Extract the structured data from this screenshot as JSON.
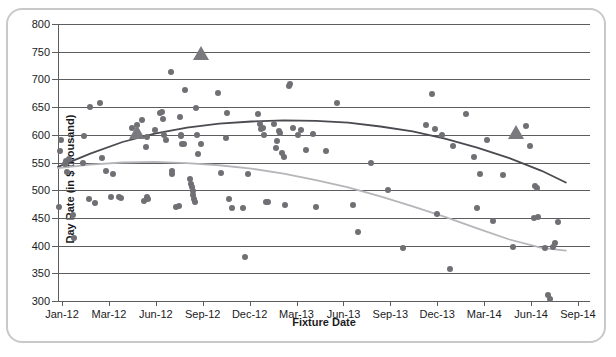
{
  "figure": {
    "title_sliver": "",
    "frame_color": "#c9c9cb"
  },
  "chart_data": {
    "type": "scatter",
    "title": "",
    "xlabel": "Fixture Date",
    "ylabel": "Day Rate (in $ thousand)",
    "ylim": [
      300,
      800
    ],
    "ytick_step": 50,
    "yticks": [
      300,
      350,
      400,
      450,
      500,
      550,
      600,
      650,
      700,
      750,
      800
    ],
    "xticks": [
      "Jan-12",
      "Mar-12",
      "Jun-12",
      "Sep-12",
      "Dec-12",
      "Mar-13",
      "Jun-13",
      "Sep-13",
      "Dec-13",
      "Mar-14",
      "Jun-14",
      "Sep-14"
    ],
    "xlim": [
      0,
      33
    ],
    "grid": "horizontal",
    "legend_position": "none",
    "colors": {
      "dot": "#6f6f74",
      "triangle": "#79797e",
      "trend_dark": "#4a4a50",
      "trend_light": "#b6b6ba",
      "axis": "#5d5d60"
    },
    "series": [
      {
        "name": "Day rate observations (circles)",
        "marker": "circle",
        "points": [
          [
            0.05,
            470
          ],
          [
            0.15,
            570
          ],
          [
            0.2,
            590
          ],
          [
            0.45,
            548
          ],
          [
            0.5,
            553
          ],
          [
            0.55,
            533
          ],
          [
            0.7,
            556
          ],
          [
            0.9,
            455
          ],
          [
            1.0,
            414
          ],
          [
            1.55,
            550
          ],
          [
            1.6,
            598
          ],
          [
            1.9,
            484
          ],
          [
            2.0,
            650
          ],
          [
            2.3,
            477
          ],
          [
            2.6,
            658
          ],
          [
            2.75,
            558
          ],
          [
            2.95,
            535
          ],
          [
            3.3,
            487
          ],
          [
            3.4,
            530
          ],
          [
            3.8,
            487
          ],
          [
            3.9,
            486
          ],
          [
            4.6,
            613
          ],
          [
            4.9,
            618
          ],
          [
            5.2,
            627
          ],
          [
            5.35,
            480
          ],
          [
            5.45,
            578
          ],
          [
            5.5,
            596
          ],
          [
            5.55,
            487
          ],
          [
            5.6,
            485
          ],
          [
            6.0,
            608
          ],
          [
            6.35,
            640
          ],
          [
            6.45,
            641
          ],
          [
            6.5,
            629
          ],
          [
            6.55,
            600
          ],
          [
            6.7,
            591
          ],
          [
            7.0,
            714
          ],
          [
            7.05,
            535
          ],
          [
            7.1,
            529
          ],
          [
            7.3,
            470
          ],
          [
            7.5,
            472
          ],
          [
            7.55,
            632
          ],
          [
            7.6,
            599
          ],
          [
            7.65,
            598
          ],
          [
            7.7,
            583
          ],
          [
            7.8,
            584
          ],
          [
            7.9,
            680
          ],
          [
            8.2,
            520
          ],
          [
            8.25,
            512
          ],
          [
            8.3,
            505
          ],
          [
            8.35,
            498
          ],
          [
            8.4,
            492
          ],
          [
            8.45,
            485
          ],
          [
            8.5,
            478
          ],
          [
            8.55,
            648
          ],
          [
            8.6,
            600
          ],
          [
            8.7,
            565
          ],
          [
            8.9,
            583
          ],
          [
            9.9,
            676
          ],
          [
            10.1,
            531
          ],
          [
            10.4,
            594
          ],
          [
            10.5,
            640
          ],
          [
            10.6,
            484
          ],
          [
            10.8,
            467
          ],
          [
            11.5,
            468
          ],
          [
            11.6,
            379
          ],
          [
            11.8,
            530
          ],
          [
            12.4,
            637
          ],
          [
            12.5,
            620
          ],
          [
            12.6,
            610
          ],
          [
            12.7,
            613
          ],
          [
            12.8,
            600
          ],
          [
            12.9,
            478
          ],
          [
            13.0,
            478
          ],
          [
            13.4,
            620
          ],
          [
            13.5,
            577
          ],
          [
            13.6,
            588
          ],
          [
            13.7,
            606
          ],
          [
            13.8,
            603
          ],
          [
            13.9,
            567
          ],
          [
            14.0,
            560
          ],
          [
            14.1,
            473
          ],
          [
            14.3,
            688
          ],
          [
            14.4,
            691
          ],
          [
            14.6,
            613
          ],
          [
            14.9,
            600
          ],
          [
            15.1,
            608
          ],
          [
            15.4,
            572
          ],
          [
            15.8,
            601
          ],
          [
            16.0,
            470
          ],
          [
            16.6,
            570
          ],
          [
            17.3,
            657
          ],
          [
            18.3,
            473
          ],
          [
            18.6,
            425
          ],
          [
            19.4,
            549
          ],
          [
            20.5,
            500
          ],
          [
            21.4,
            395
          ],
          [
            22.8,
            618
          ],
          [
            23.2,
            673
          ],
          [
            23.4,
            611
          ],
          [
            23.5,
            457
          ],
          [
            23.8,
            600
          ],
          [
            24.3,
            357
          ],
          [
            24.5,
            580
          ],
          [
            25.3,
            638
          ],
          [
            25.8,
            560
          ],
          [
            26.0,
            468
          ],
          [
            26.2,
            530
          ],
          [
            26.6,
            590
          ],
          [
            27.0,
            444
          ],
          [
            27.6,
            527
          ],
          [
            28.2,
            398
          ],
          [
            29.0,
            615
          ],
          [
            29.3,
            580
          ],
          [
            29.5,
            449
          ],
          [
            29.6,
            508
          ],
          [
            29.7,
            504
          ],
          [
            29.8,
            451
          ],
          [
            30.2,
            396
          ],
          [
            30.4,
            311
          ],
          [
            30.5,
            303
          ],
          [
            30.7,
            398
          ],
          [
            30.8,
            405
          ],
          [
            31.0,
            442
          ]
        ]
      },
      {
        "name": "Benchmark fixtures (triangles)",
        "marker": "triangle",
        "points": [
          [
            4.9,
            605
          ],
          [
            8.9,
            748
          ],
          [
            28.4,
            605
          ]
        ]
      }
    ],
    "trendlines": [
      {
        "name": "Dark polynomial trend",
        "color": "#4a4a50",
        "points": [
          [
            0.0,
            542
          ],
          [
            2.0,
            566
          ],
          [
            4.0,
            587
          ],
          [
            6.0,
            602
          ],
          [
            8.0,
            613
          ],
          [
            10.0,
            620
          ],
          [
            12.0,
            624
          ],
          [
            14.0,
            626
          ],
          [
            16.0,
            625
          ],
          [
            18.0,
            622
          ],
          [
            20.0,
            615
          ],
          [
            22.0,
            606
          ],
          [
            24.0,
            593
          ],
          [
            26.0,
            577
          ],
          [
            28.0,
            558
          ],
          [
            30.0,
            535
          ],
          [
            31.5,
            514
          ]
        ]
      },
      {
        "name": "Light polynomial trend",
        "color": "#b6b6ba",
        "points": [
          [
            0.0,
            540
          ],
          [
            2.0,
            546
          ],
          [
            4.0,
            550
          ],
          [
            6.0,
            551
          ],
          [
            8.0,
            549
          ],
          [
            10.0,
            545
          ],
          [
            12.0,
            539
          ],
          [
            14.0,
            530
          ],
          [
            16.0,
            518
          ],
          [
            18.0,
            505
          ],
          [
            20.0,
            489
          ],
          [
            22.0,
            471
          ],
          [
            24.0,
            452
          ],
          [
            26.0,
            431
          ],
          [
            28.0,
            411
          ],
          [
            30.0,
            396
          ],
          [
            31.5,
            391
          ]
        ]
      }
    ]
  }
}
